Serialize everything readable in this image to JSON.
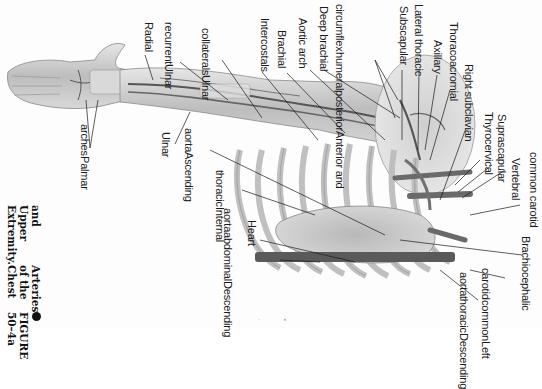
{
  "figure": {
    "number": "FIGURE 50-4a",
    "title": "Arteries of the Chest and Upper Extremity.",
    "caption_lines": [
      "FIGURE 50–4a",
      "Arteries of the Chest",
      "and Upper Extremity."
    ],
    "orientation": "rotated 90° clockwise"
  },
  "labels": {
    "radial": "Radial",
    "ulnar_recurrent": [
      "Ulnar",
      "recurrent"
    ],
    "ulnar_collaterals": [
      "Ulnar",
      "collaterals"
    ],
    "intercostals": "Intercostals",
    "brachial": "Brachial",
    "aortic_arch": "Aortic arch",
    "deep_brachial": "Deep brachial",
    "ant_post_humeral_circumflex": [
      "Anterior and",
      "posterior",
      "humeral",
      "circumflex"
    ],
    "subscapular": "Subscapular",
    "lateral_thoracic": "Lateral thoracic",
    "axillary": "Axillary",
    "thoracoacromial": "Thoracoacromial",
    "right_subclavian": "Right subclavian",
    "thyrocervical": "Thyrocervical",
    "suprascapular": "Suprascapular",
    "vertebral": "Vertebral",
    "common_carotid": "common carotid",
    "brachiocephalic": "Brachiocephalic",
    "left_common_carotid": [
      "Left",
      "common",
      "carotid"
    ],
    "descending_thoracic_aorta": [
      "Descending",
      "thoracic",
      "aorta"
    ],
    "palmar_arches": [
      "Palmar",
      "arches"
    ],
    "ulnar": "Ulnar",
    "ascending_aorta": [
      "Ascending",
      "aorta"
    ],
    "internal_thoracic": [
      "Internal",
      "thoracic"
    ],
    "heart": "Heart",
    "descending_abdominal_aorta": [
      "Descending",
      "abdominal",
      "aorta"
    ]
  },
  "colors": {
    "tissue": "#c9c9c9",
    "tissue_dark": "#8a8a8a",
    "artery": "#555555",
    "leader": "#1a1a1a",
    "paper": "#fdfdfd"
  }
}
